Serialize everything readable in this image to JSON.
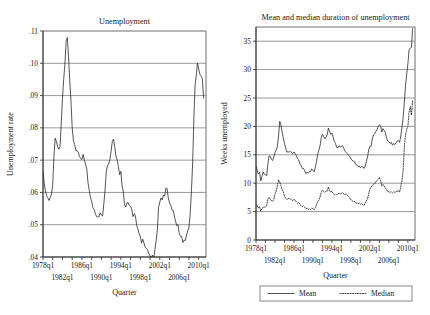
{
  "figure": {
    "background_color": "#ffffff",
    "line_color": "#1c1c1c",
    "grid_color": "#8d8d8d"
  },
  "chart_data": [
    {
      "id": "unemployment-rate",
      "type": "line",
      "title": "Unemployment",
      "xlabel": "Quarter",
      "ylabel": "Unemployment rate",
      "xlim": [
        1978.0,
        2011.5
      ],
      "ylim": [
        0.04,
        0.11
      ],
      "grid": true,
      "legend": "none",
      "yticks": [
        0.04,
        0.05,
        0.06,
        0.07,
        0.08,
        0.09,
        0.1,
        0.11
      ],
      "yticklabels": [
        ".04",
        ".05",
        ".06",
        ".07",
        ".08",
        ".09",
        ".10",
        ".11"
      ],
      "xticks": [
        1978,
        1982,
        1986,
        1990,
        1994,
        1998,
        2002,
        2006,
        2010
      ],
      "xticklabels": [
        "1978q1",
        "1982q1",
        "1986q1",
        "1990q1",
        "1994q1",
        "1998q1",
        "2002q1",
        "2006q1",
        "2010q1"
      ],
      "xticklabels_row_top": [
        "1978q1",
        "1986q1",
        "1994q1",
        "2002q1",
        "2010q1"
      ],
      "xticklabels_row_bottom": [
        "1982q1",
        "1990q1",
        "1998q1",
        "2006q1"
      ],
      "minor_xticks": [
        1980,
        1984,
        1988,
        1992,
        1996,
        2000,
        2004,
        2008
      ],
      "series": [
        {
          "name": "Unemployment rate",
          "style": "solid",
          "x": [
            1978.0,
            1978.25,
            1978.5,
            1978.75,
            1979.0,
            1979.25,
            1979.5,
            1979.75,
            1980.0,
            1980.25,
            1980.5,
            1980.75,
            1981.0,
            1981.25,
            1981.5,
            1981.75,
            1982.0,
            1982.25,
            1982.5,
            1982.75,
            1983.0,
            1983.25,
            1983.5,
            1983.75,
            1984.0,
            1984.25,
            1984.5,
            1984.75,
            1985.0,
            1985.25,
            1985.5,
            1985.75,
            1986.0,
            1986.25,
            1986.5,
            1986.75,
            1987.0,
            1987.25,
            1987.5,
            1987.75,
            1988.0,
            1988.25,
            1988.5,
            1988.75,
            1989.0,
            1989.25,
            1989.5,
            1989.75,
            1990.0,
            1990.25,
            1990.5,
            1990.75,
            1991.0,
            1991.25,
            1991.5,
            1991.75,
            1992.0,
            1992.25,
            1992.5,
            1992.75,
            1993.0,
            1993.25,
            1993.5,
            1993.75,
            1994.0,
            1994.25,
            1994.5,
            1994.75,
            1995.0,
            1995.25,
            1995.5,
            1995.75,
            1996.0,
            1996.25,
            1996.5,
            1996.75,
            1997.0,
            1997.25,
            1997.5,
            1997.75,
            1998.0,
            1998.25,
            1998.5,
            1998.75,
            1999.0,
            1999.25,
            1999.5,
            1999.75,
            2000.0,
            2000.25,
            2000.5,
            2000.75,
            2001.0,
            2001.25,
            2001.5,
            2001.75,
            2002.0,
            2002.25,
            2002.5,
            2002.75,
            2003.0,
            2003.25,
            2003.5,
            2003.75,
            2004.0,
            2004.25,
            2004.5,
            2004.75,
            2005.0,
            2005.25,
            2005.5,
            2005.75,
            2006.0,
            2006.25,
            2006.5,
            2006.75,
            2007.0,
            2007.25,
            2007.5,
            2007.75,
            2008.0,
            2008.25,
            2008.5,
            2008.75,
            2009.0,
            2009.25,
            2009.5,
            2009.75,
            2010.0,
            2010.25,
            2010.5,
            2010.75,
            2011.0
          ],
          "y": [
            0.0665,
            0.0628,
            0.0605,
            0.059,
            0.0583,
            0.0575,
            0.0585,
            0.0595,
            0.0625,
            0.0712,
            0.0768,
            0.0758,
            0.0742,
            0.0734,
            0.0742,
            0.0815,
            0.089,
            0.095,
            0.0997,
            0.1068,
            0.108,
            0.102,
            0.0945,
            0.0883,
            0.08,
            0.076,
            0.0748,
            0.073,
            0.0729,
            0.0724,
            0.0711,
            0.0705,
            0.0702,
            0.0718,
            0.07,
            0.0688,
            0.0672,
            0.063,
            0.0607,
            0.0585,
            0.0572,
            0.0553,
            0.0547,
            0.0535,
            0.0525,
            0.0524,
            0.0525,
            0.0537,
            0.053,
            0.0527,
            0.0565,
            0.0607,
            0.0665,
            0.0682,
            0.0688,
            0.0702,
            0.0728,
            0.0759,
            0.0765,
            0.074,
            0.0713,
            0.07,
            0.068,
            0.0655,
            0.0665,
            0.062,
            0.0605,
            0.0562,
            0.0555,
            0.0568,
            0.0568,
            0.0559,
            0.0557,
            0.0546,
            0.0525,
            0.0534,
            0.0527,
            0.0498,
            0.0487,
            0.0472,
            0.0464,
            0.0443,
            0.0455,
            0.0444,
            0.043,
            0.0427,
            0.0422,
            0.041,
            0.0403,
            0.0398,
            0.0406,
            0.0395,
            0.0423,
            0.045,
            0.0482,
            0.0553,
            0.057,
            0.0583,
            0.0577,
            0.0592,
            0.0588,
            0.0613,
            0.0612,
            0.0583,
            0.0568,
            0.056,
            0.0546,
            0.0544,
            0.0527,
            0.051,
            0.0497,
            0.05,
            0.0473,
            0.0464,
            0.0464,
            0.0445,
            0.0452,
            0.0451,
            0.0468,
            0.0481,
            0.0493,
            0.0533,
            0.0602,
            0.0688,
            0.0826,
            0.093,
            0.0963,
            0.1001,
            0.0982,
            0.0966,
            0.0961,
            0.0952,
            0.0892
          ]
        }
      ]
    },
    {
      "id": "unemployment-duration",
      "type": "line",
      "title": "Mean and median duration of unemployment",
      "xlabel": "Quarter",
      "ylabel": "Weeks unemployed",
      "xlim": [
        1978.0,
        2011.5
      ],
      "ylim": [
        0,
        37.5
      ],
      "grid": true,
      "legend": "bottom",
      "yticks": [
        0,
        5,
        10,
        15,
        20,
        25,
        30,
        35
      ],
      "yticklabels": [
        "0",
        "5",
        "10",
        "15",
        "20",
        "25",
        "30",
        "35"
      ],
      "xticks": [
        1978,
        1982,
        1986,
        1990,
        1994,
        1998,
        2002,
        2006,
        2010
      ],
      "xticklabels": [
        "1978q1",
        "1982q1",
        "1986q1",
        "1990q1",
        "1994q1",
        "1998q1",
        "2002q1",
        "2006q1",
        "2010q1"
      ],
      "xticklabels_row_top": [
        "1978q1",
        "1986q1",
        "1994q1",
        "2002q1",
        "2010q1"
      ],
      "xticklabels_row_bottom": [
        "1982q1",
        "1990q1",
        "1998q1",
        "2006q1"
      ],
      "minor_xticks": [
        1980,
        1984,
        1988,
        1992,
        1996,
        2000,
        2004,
        2008
      ],
      "series": [
        {
          "name": "Mean",
          "style": "solid",
          "x": [
            1978.0,
            1978.25,
            1978.5,
            1978.75,
            1979.0,
            1979.25,
            1979.5,
            1979.75,
            1980.0,
            1980.25,
            1980.5,
            1980.75,
            1981.0,
            1981.25,
            1981.5,
            1981.75,
            1982.0,
            1982.25,
            1982.5,
            1982.75,
            1983.0,
            1983.25,
            1983.5,
            1983.75,
            1984.0,
            1984.25,
            1984.5,
            1984.75,
            1985.0,
            1985.25,
            1985.5,
            1985.75,
            1986.0,
            1986.25,
            1986.5,
            1986.75,
            1987.0,
            1987.25,
            1987.5,
            1987.75,
            1988.0,
            1988.25,
            1988.5,
            1988.75,
            1989.0,
            1989.25,
            1989.5,
            1989.75,
            1990.0,
            1990.25,
            1990.5,
            1990.75,
            1991.0,
            1991.25,
            1991.5,
            1991.75,
            1992.0,
            1992.25,
            1992.5,
            1992.75,
            1993.0,
            1993.25,
            1993.5,
            1993.75,
            1994.0,
            1994.25,
            1994.5,
            1994.75,
            1995.0,
            1995.25,
            1995.5,
            1995.75,
            1996.0,
            1996.25,
            1996.5,
            1996.75,
            1997.0,
            1997.25,
            1997.5,
            1997.75,
            1998.0,
            1998.25,
            1998.5,
            1998.75,
            1999.0,
            1999.25,
            1999.5,
            1999.75,
            2000.0,
            2000.25,
            2000.5,
            2000.75,
            2001.0,
            2001.25,
            2001.5,
            2001.75,
            2002.0,
            2002.25,
            2002.5,
            2002.75,
            2003.0,
            2003.25,
            2003.5,
            2003.75,
            2004.0,
            2004.25,
            2004.5,
            2004.75,
            2005.0,
            2005.25,
            2005.5,
            2005.75,
            2006.0,
            2006.25,
            2006.5,
            2006.75,
            2007.0,
            2007.25,
            2007.5,
            2007.75,
            2008.0,
            2008.25,
            2008.5,
            2008.75,
            2009.0,
            2009.25,
            2009.5,
            2009.75,
            2010.0,
            2010.25,
            2010.5,
            2010.75,
            2011.0
          ],
          "y": [
            13.0,
            12.3,
            11.6,
            11.9,
            10.4,
            11.2,
            12.0,
            11.6,
            11.5,
            11.3,
            13.4,
            14.8,
            14.7,
            14.2,
            14.0,
            14.6,
            15.4,
            15.8,
            16.5,
            18.3,
            20.9,
            20.3,
            19.0,
            18.0,
            17.0,
            16.2,
            15.5,
            15.5,
            15.5,
            15.6,
            15.4,
            15.2,
            15.5,
            15.2,
            14.9,
            14.3,
            14.1,
            13.4,
            13.1,
            12.6,
            12.6,
            12.2,
            11.7,
            11.9,
            11.8,
            12.0,
            12.1,
            12.5,
            12.3,
            12.0,
            12.8,
            13.8,
            15.1,
            15.8,
            16.6,
            18.0,
            18.6,
            18.2,
            17.8,
            18.1,
            18.5,
            19.7,
            19.1,
            18.6,
            18.8,
            18.1,
            17.4,
            17.0,
            16.3,
            16.2,
            16.6,
            16.4,
            16.5,
            16.6,
            16.1,
            15.6,
            15.4,
            15.2,
            14.9,
            14.7,
            14.3,
            14.0,
            13.9,
            13.8,
            13.3,
            13.2,
            12.9,
            13.0,
            12.7,
            12.9,
            12.9,
            12.6,
            13.0,
            13.8,
            14.6,
            15.9,
            16.5,
            16.5,
            17.8,
            18.5,
            18.7,
            19.1,
            19.4,
            20.0,
            20.3,
            20.1,
            19.0,
            19.6,
            19.3,
            18.9,
            18.0,
            17.4,
            17.3,
            17.0,
            17.2,
            16.7,
            17.0,
            16.8,
            17.1,
            17.4,
            17.5,
            17.2,
            18.3,
            19.8,
            21.5,
            24.2,
            27.1,
            29.2,
            31.0,
            33.5,
            33.8,
            33.9,
            37.2
          ]
        },
        {
          "name": "Median",
          "style": "dashed",
          "x": [
            1978.0,
            1978.25,
            1978.5,
            1978.75,
            1979.0,
            1979.25,
            1979.5,
            1979.75,
            1980.0,
            1980.25,
            1980.5,
            1980.75,
            1981.0,
            1981.25,
            1981.5,
            1981.75,
            1982.0,
            1982.25,
            1982.5,
            1982.75,
            1983.0,
            1983.25,
            1983.5,
            1983.75,
            1984.0,
            1984.25,
            1984.5,
            1984.75,
            1985.0,
            1985.25,
            1985.5,
            1985.75,
            1986.0,
            1986.25,
            1986.5,
            1986.75,
            1987.0,
            1987.25,
            1987.5,
            1987.75,
            1988.0,
            1988.25,
            1988.5,
            1988.75,
            1989.0,
            1989.25,
            1989.5,
            1989.75,
            1990.0,
            1990.25,
            1990.5,
            1990.75,
            1991.0,
            1991.25,
            1991.5,
            1991.75,
            1992.0,
            1992.25,
            1992.5,
            1992.75,
            1993.0,
            1993.25,
            1993.5,
            1993.75,
            1994.0,
            1994.25,
            1994.5,
            1994.75,
            1995.0,
            1995.25,
            1995.5,
            1995.75,
            1996.0,
            1996.25,
            1996.5,
            1996.75,
            1997.0,
            1997.25,
            1997.5,
            1997.75,
            1998.0,
            1998.25,
            1998.5,
            1998.75,
            1999.0,
            1999.25,
            1999.5,
            1999.75,
            2000.0,
            2000.25,
            2000.5,
            2000.75,
            2001.0,
            2001.25,
            2001.5,
            2001.75,
            2002.0,
            2002.25,
            2002.5,
            2002.75,
            2003.0,
            2003.25,
            2003.5,
            2003.75,
            2004.0,
            2004.25,
            2004.5,
            2004.75,
            2005.0,
            2005.25,
            2005.5,
            2005.75,
            2006.0,
            2006.25,
            2006.5,
            2006.75,
            2007.0,
            2007.25,
            2007.5,
            2007.75,
            2008.0,
            2008.25,
            2008.5,
            2008.75,
            2009.0,
            2009.25,
            2009.5,
            2009.75,
            2010.0,
            2010.25,
            2010.5,
            2010.75,
            2011.0
          ],
          "y": [
            6.3,
            6.0,
            5.6,
            5.9,
            5.1,
            5.5,
            5.8,
            5.8,
            5.8,
            6.1,
            7.2,
            7.5,
            7.2,
            6.9,
            6.8,
            7.1,
            8.1,
            8.6,
            9.5,
            10.6,
            10.2,
            9.6,
            8.9,
            8.5,
            7.7,
            7.4,
            7.1,
            7.3,
            7.3,
            7.2,
            7.1,
            6.9,
            7.2,
            7.0,
            6.7,
            6.5,
            6.6,
            6.3,
            6.0,
            5.9,
            6.0,
            5.8,
            5.5,
            5.6,
            5.4,
            5.5,
            5.4,
            5.6,
            5.5,
            5.3,
            5.7,
            6.2,
            6.8,
            7.0,
            7.6,
            8.4,
            8.8,
            8.6,
            8.4,
            8.6,
            8.6,
            9.3,
            8.6,
            8.5,
            8.6,
            8.2,
            8.0,
            8.0,
            8.0,
            8.1,
            8.2,
            8.1,
            8.2,
            8.3,
            8.1,
            8.0,
            8.1,
            7.9,
            7.6,
            7.4,
            7.1,
            6.9,
            6.8,
            6.8,
            6.5,
            6.5,
            6.4,
            6.5,
            6.3,
            6.4,
            6.2,
            6.1,
            6.5,
            6.9,
            7.3,
            8.1,
            9.0,
            9.3,
            9.6,
            9.8,
            9.9,
            10.2,
            10.5,
            10.7,
            11.0,
            10.5,
            9.5,
            9.8,
            9.5,
            9.1,
            8.9,
            8.5,
            8.5,
            8.4,
            8.5,
            8.3,
            8.5,
            8.4,
            8.5,
            8.6,
            8.7,
            8.4,
            9.4,
            10.5,
            12.2,
            16.2,
            18.5,
            19.5,
            20.0,
            22.5,
            23.5,
            22.0,
            24.5
          ]
        }
      ],
      "legend_entries": [
        {
          "label": "Mean",
          "style": "solid"
        },
        {
          "label": "Median",
          "style": "dashed"
        }
      ]
    }
  ]
}
